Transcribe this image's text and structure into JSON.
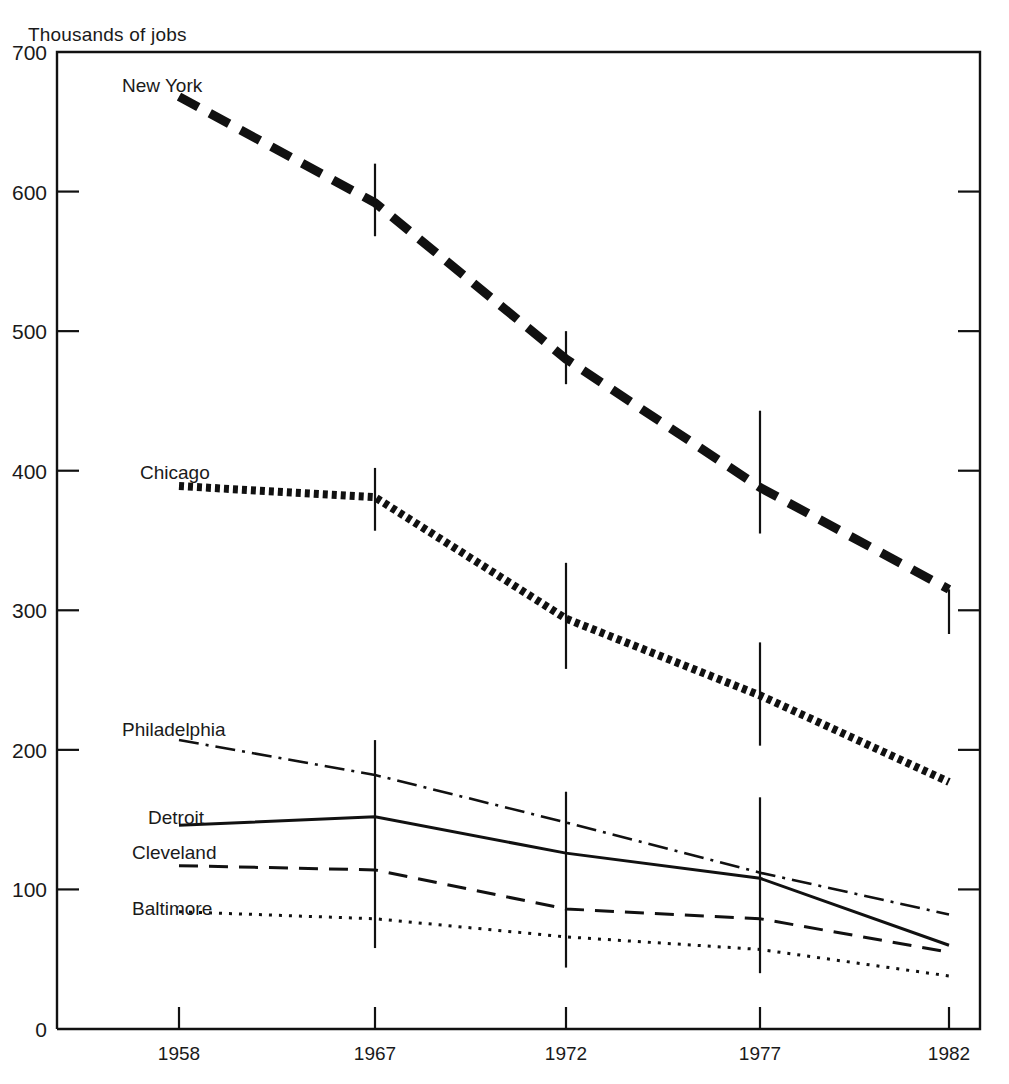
{
  "chart_data": {
    "type": "line",
    "title": "",
    "ylabel": "Thousands of jobs",
    "xlabel": "",
    "categories": [
      "1958",
      "1967",
      "1972",
      "1977",
      "1982"
    ],
    "x": [
      1958,
      1967,
      1972,
      1977,
      1982
    ],
    "ylim": [
      0,
      700
    ],
    "yticks": [
      0,
      100,
      200,
      300,
      400,
      500,
      600,
      700
    ],
    "ytick_labels": [
      "0",
      "100",
      "200",
      "300",
      "400",
      "500",
      "600",
      "700"
    ],
    "xtick_labels": [
      "1958",
      "1967",
      "1972",
      "1977",
      "1982"
    ],
    "grid": false,
    "legend": "inline-labels",
    "note": "Error bars drawn as vertical whiskers at 1967, 1972, 1977 and 1982 data points",
    "series": [
      {
        "name": "New York",
        "label": "New York",
        "style": "heavy-dashed",
        "color": "#111111",
        "values": [
          668,
          592,
          480,
          388,
          315
        ],
        "err_low": [
          null,
          568,
          462,
          355,
          283
        ],
        "err_high": [
          null,
          620,
          500,
          443,
          315
        ]
      },
      {
        "name": "Chicago",
        "label": "Chicago",
        "style": "heavy-dotted",
        "color": "#111111",
        "values": [
          389,
          381,
          294,
          239,
          177
        ],
        "err_low": [
          null,
          357,
          258,
          203,
          null
        ],
        "err_high": [
          null,
          402,
          334,
          277,
          null
        ]
      },
      {
        "name": "Philadelphia",
        "label": "Philadelphia",
        "style": "dash-dot",
        "color": "#111111",
        "values": [
          207,
          182,
          148,
          112,
          82
        ],
        "err_low": [
          null,
          null,
          null,
          null,
          null
        ],
        "err_high": [
          null,
          null,
          null,
          null,
          null
        ]
      },
      {
        "name": "Detroit",
        "label": "Detroit",
        "style": "solid",
        "color": "#111111",
        "values": [
          146,
          152,
          126,
          108,
          60
        ],
        "err_low": [
          null,
          58,
          44,
          40,
          null
        ],
        "err_high": [
          null,
          207,
          170,
          166,
          null
        ]
      },
      {
        "name": "Cleveland",
        "label": "Cleveland",
        "style": "dashed",
        "color": "#111111",
        "values": [
          117,
          114,
          86,
          79,
          55
        ],
        "err_low": [
          null,
          null,
          null,
          null,
          null
        ],
        "err_high": [
          null,
          null,
          null,
          null,
          null
        ]
      },
      {
        "name": "Baltimore",
        "label": "Baltimore",
        "style": "dotted",
        "color": "#111111",
        "values": [
          84,
          79,
          66,
          57,
          38
        ],
        "err_low": [
          null,
          null,
          null,
          null,
          null
        ],
        "err_high": [
          null,
          null,
          null,
          null,
          null
        ]
      }
    ],
    "series_label_positions": [
      {
        "name": "New York",
        "x": 122,
        "y": 92
      },
      {
        "name": "Chicago",
        "x": 140,
        "y": 479
      },
      {
        "name": "Philadelphia",
        "x": 122,
        "y": 736
      },
      {
        "name": "Detroit",
        "x": 148,
        "y": 824
      },
      {
        "name": "Cleveland",
        "x": 132,
        "y": 859
      },
      {
        "name": "Baltimore",
        "x": 132,
        "y": 915
      }
    ]
  }
}
